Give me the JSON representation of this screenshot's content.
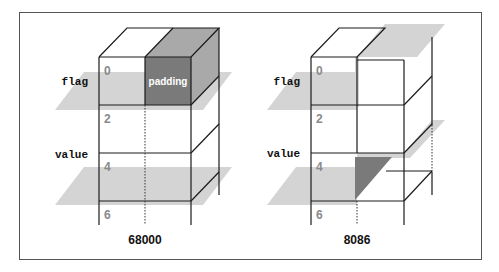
{
  "diagrams": [
    {
      "architecture": "68000",
      "fields": [
        "flag",
        "value"
      ],
      "offsets": [
        "0",
        "2",
        "4",
        "6"
      ],
      "padding_label": "padding"
    },
    {
      "architecture": "8086",
      "fields": [
        "flag",
        "value"
      ],
      "offsets": [
        "0",
        "2",
        "4",
        "6"
      ]
    }
  ],
  "colors": {
    "plane": "#d4d4d4",
    "padding_front": "#7a7a7a",
    "padding_side": "#a9a9a9",
    "offset_text": "#8a8a8a"
  }
}
